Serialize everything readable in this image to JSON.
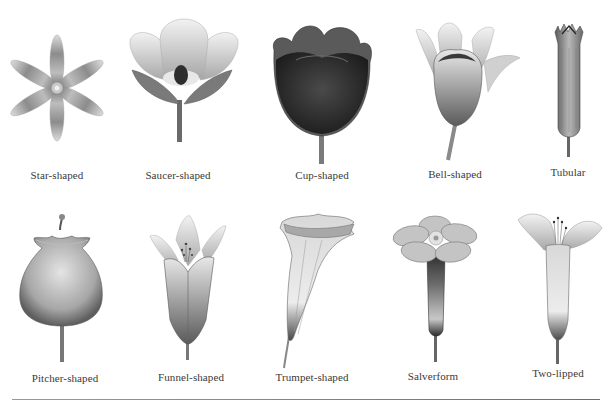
{
  "diagram": {
    "rows": [
      {
        "items": [
          {
            "id": "star",
            "label": "Star-shaped",
            "icon": "star-shaped-flower-icon"
          },
          {
            "id": "saucer",
            "label": "Saucer-shaped",
            "icon": "saucer-shaped-flower-icon"
          },
          {
            "id": "cup",
            "label": "Cup-shaped",
            "icon": "cup-shaped-flower-icon"
          },
          {
            "id": "bell",
            "label": "Bell-shaped",
            "icon": "bell-shaped-flower-icon"
          },
          {
            "id": "tubular",
            "label": "Tubular",
            "icon": "tubular-flower-icon"
          }
        ]
      },
      {
        "items": [
          {
            "id": "pitcher",
            "label": "Pitcher-shaped",
            "icon": "pitcher-shaped-flower-icon"
          },
          {
            "id": "funnel",
            "label": "Funnel-shaped",
            "icon": "funnel-shaped-flower-icon"
          },
          {
            "id": "trumpet",
            "label": "Trumpet-shaped",
            "icon": "trumpet-shaped-flower-icon"
          },
          {
            "id": "salverform",
            "label": "Salverform",
            "icon": "salverform-flower-icon"
          },
          {
            "id": "twolipped",
            "label": "Two-lipped",
            "icon": "two-lipped-flower-icon"
          }
        ]
      }
    ],
    "colors": {
      "background": "#ffffff",
      "label_text": "#3a3a3a",
      "divider": "#7a7a7a",
      "flower_dark": "#2e2e2e",
      "flower_mid": "#8a8a8a",
      "flower_light": "#e6e6e6"
    }
  }
}
